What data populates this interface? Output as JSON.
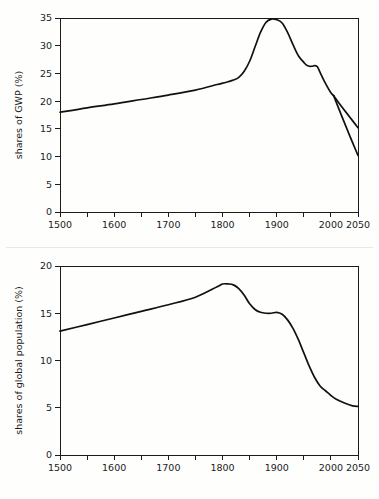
{
  "page": {
    "background_color": "#fefefd",
    "line_color": "#111111",
    "axis_color": "#1b1b1b",
    "width": 379,
    "height": 499
  },
  "chart_data": [
    {
      "id": "gwp",
      "type": "line",
      "title": "",
      "xlabel": "",
      "ylabel": "shares of GWP (%)",
      "xlim": [
        1500,
        2050
      ],
      "ylim": [
        0,
        35
      ],
      "grid": false,
      "legend": null,
      "x_ticks": [
        1500,
        1550,
        1600,
        1650,
        1700,
        1750,
        1800,
        1850,
        1900,
        1950,
        2000,
        2050
      ],
      "x_tick_labels": [
        "1500",
        "",
        "1600",
        "",
        "1700",
        "",
        "1800",
        "",
        "1900",
        "",
        "2000",
        "2050"
      ],
      "y_ticks": [
        0,
        5,
        10,
        15,
        20,
        25,
        30,
        35
      ],
      "y_tick_labels": [
        "0",
        "5",
        "10",
        "15",
        "20",
        "25",
        "30",
        "35"
      ],
      "series": [
        {
          "name": "shares of GWP main",
          "x": [
            1500,
            1550,
            1600,
            1650,
            1700,
            1750,
            1790,
            1810,
            1820,
            1830,
            1840,
            1850,
            1860,
            1870,
            1880,
            1890,
            1900,
            1910,
            1920,
            1930,
            1940,
            1950,
            1955,
            1960,
            1965,
            1970,
            1975,
            1980,
            1990,
            2000,
            2005
          ],
          "values": [
            18.0,
            18.8,
            19.5,
            20.3,
            21.1,
            22.0,
            23.0,
            23.5,
            23.8,
            24.3,
            25.4,
            27.2,
            29.8,
            32.4,
            34.2,
            34.8,
            34.7,
            34.1,
            32.4,
            30.2,
            28.2,
            27.0,
            26.5,
            26.3,
            26.3,
            26.4,
            26.2,
            25.2,
            23.2,
            21.5,
            21.0
          ]
        },
        {
          "name": "projection upper",
          "x": [
            2005,
            2020,
            2035,
            2050
          ],
          "values": [
            21.0,
            19.0,
            17.1,
            15.2
          ]
        },
        {
          "name": "projection lower",
          "x": [
            2005,
            2020,
            2035,
            2050
          ],
          "values": [
            21.0,
            17.3,
            13.7,
            10.2
          ]
        }
      ]
    },
    {
      "id": "population",
      "type": "line",
      "title": "",
      "xlabel": "",
      "ylabel": "shares of global population (%)",
      "xlim": [
        1500,
        2050
      ],
      "ylim": [
        0,
        20
      ],
      "grid": false,
      "legend": null,
      "x_ticks": [
        1500,
        1550,
        1600,
        1650,
        1700,
        1750,
        1800,
        1850,
        1900,
        1950,
        2000,
        2050
      ],
      "x_tick_labels": [
        "1500",
        "",
        "1600",
        "",
        "1700",
        "",
        "1800",
        "",
        "1900",
        "",
        "2000",
        "2050"
      ],
      "y_ticks": [
        0,
        5,
        10,
        15,
        20
      ],
      "y_tick_labels": [
        "0",
        "5",
        "10",
        "15",
        "20"
      ],
      "series": [
        {
          "name": "shares of global population",
          "x": [
            1500,
            1550,
            1600,
            1650,
            1700,
            1750,
            1790,
            1800,
            1810,
            1820,
            1830,
            1840,
            1850,
            1860,
            1870,
            1880,
            1890,
            1900,
            1910,
            1920,
            1930,
            1940,
            1950,
            1960,
            1970,
            1980,
            1990,
            2000,
            2010,
            2025,
            2040,
            2050
          ],
          "values": [
            13.1,
            13.8,
            14.5,
            15.2,
            15.9,
            16.7,
            17.8,
            18.1,
            18.1,
            18.0,
            17.6,
            16.9,
            16.0,
            15.4,
            15.1,
            15.0,
            15.0,
            15.1,
            14.9,
            14.3,
            13.4,
            12.2,
            10.8,
            9.4,
            8.2,
            7.3,
            6.8,
            6.3,
            5.9,
            5.5,
            5.2,
            5.15
          ]
        }
      ]
    }
  ]
}
